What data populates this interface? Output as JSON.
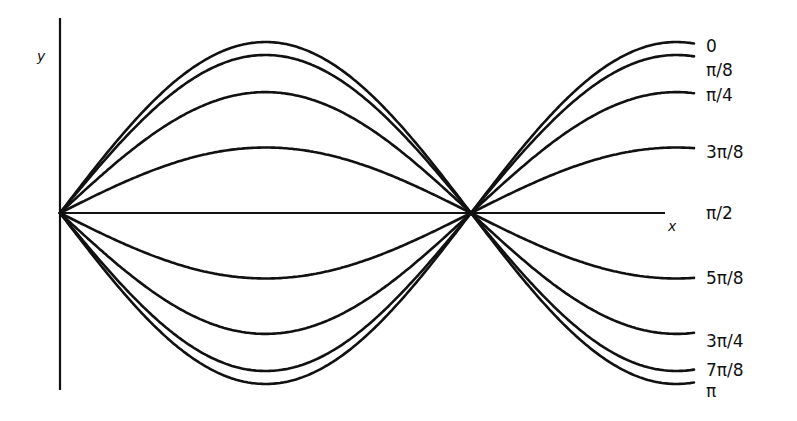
{
  "figure": {
    "axes": {
      "x_label": "x",
      "y_label": "y"
    },
    "phase_labels": [
      "0",
      "π/8",
      "π/4",
      "3π/8",
      "π/2",
      "5π/8",
      "3π/4",
      "7π/8",
      "π"
    ],
    "stroke_color": "#111111",
    "background": "#ffffff"
  },
  "chart_data": {
    "type": "line",
    "title": "",
    "xlabel": "x",
    "ylabel": "y",
    "series": [
      {
        "name": "0",
        "phase": 0,
        "amplitude_factor": 1.0
      },
      {
        "name": "π/8",
        "phase": 0.3927,
        "amplitude_factor": 0.924
      },
      {
        "name": "π/4",
        "phase": 0.7854,
        "amplitude_factor": 0.707
      },
      {
        "name": "3π/8",
        "phase": 1.1781,
        "amplitude_factor": 0.383
      },
      {
        "name": "π/2",
        "phase": 1.5708,
        "amplitude_factor": 0.0
      },
      {
        "name": "5π/8",
        "phase": 1.9635,
        "amplitude_factor": -0.383
      },
      {
        "name": "3π/4",
        "phase": 2.3562,
        "amplitude_factor": -0.707
      },
      {
        "name": "7π/8",
        "phase": 2.7489,
        "amplitude_factor": -0.924
      },
      {
        "name": "π",
        "phase": 3.1416,
        "amplitude_factor": -1.0
      }
    ],
    "grid": false,
    "legend_position": "right (labels at curve ends)"
  }
}
